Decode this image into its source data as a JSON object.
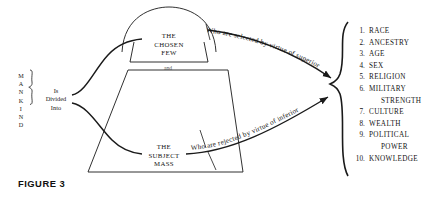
{
  "figure": {
    "label": "FIGURE 3",
    "source_group": {
      "name": "MANKIND",
      "letters": [
        "M",
        "A",
        "N",
        "K",
        "I",
        "N",
        "D"
      ],
      "action_lines": [
        "Is",
        "Divided",
        "Into"
      ]
    },
    "groups": [
      {
        "id": "chosen-few",
        "caption_lines": [
          "THE",
          "CHOSEN",
          "FEW"
        ],
        "selector_text": "Who are selected by virtue of superior"
      },
      {
        "id": "subject-mass",
        "caption_lines": [
          "THE",
          "SUBJECT",
          "MASS"
        ],
        "selector_text": "Who are rejected by virtue of inferior"
      }
    ],
    "connector_word": "and",
    "criteria": {
      "items": [
        {
          "num": "1.",
          "lines": [
            "RACE"
          ]
        },
        {
          "num": "2.",
          "lines": [
            "ANCESTRY"
          ]
        },
        {
          "num": "3.",
          "lines": [
            "AGE"
          ]
        },
        {
          "num": "4.",
          "lines": [
            "SEX"
          ]
        },
        {
          "num": "5.",
          "lines": [
            "RELIGION"
          ]
        },
        {
          "num": "6.",
          "lines": [
            "MILITARY",
            "STRENGTH"
          ]
        },
        {
          "num": "7.",
          "lines": [
            "CULTURE"
          ]
        },
        {
          "num": "8.",
          "lines": [
            "WEALTH"
          ]
        },
        {
          "num": "9.",
          "lines": [
            "POLITICAL",
            "POWER"
          ]
        },
        {
          "num": "10.",
          "lines": [
            "KNOWLEDGE"
          ]
        }
      ]
    },
    "colors": {
      "ink": "#1a1a1a",
      "paper": "#ffffff"
    }
  }
}
